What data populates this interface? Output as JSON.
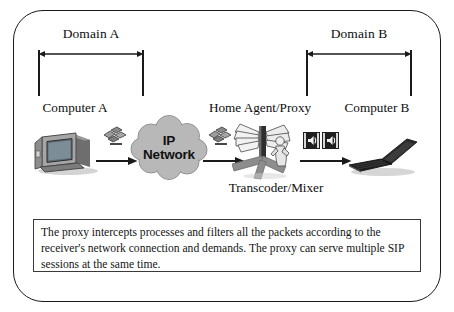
{
  "figure": {
    "domains": [
      {
        "label": "Domain A",
        "side": "left"
      },
      {
        "label": "Domain B",
        "side": "right"
      }
    ],
    "nodes": [
      {
        "id": "computer-a",
        "label": "Computer A",
        "icon": "desktop-computer-icon"
      },
      {
        "id": "ip-network",
        "label": "IP",
        "label2": "Network",
        "icon": "network-cloud-icon"
      },
      {
        "id": "home-agent-proxy",
        "label": "Home Agent/Proxy",
        "icon": "proxy-filter-icon"
      },
      {
        "id": "transcoder-mixer",
        "label": "Transcoder/Mixer",
        "icon": "transcoder-icon"
      },
      {
        "id": "computer-b",
        "label": "Computer B",
        "icon": "laptop-computer-icon"
      }
    ],
    "packets": [
      {
        "id": "packet-1",
        "icon": "packet-cluster-icon"
      },
      {
        "id": "packet-2",
        "icon": "packet-cluster-icon"
      },
      {
        "id": "media-1",
        "icon": "speaker-media-icon"
      },
      {
        "id": "media-2",
        "icon": "speaker-media-icon"
      }
    ],
    "note": "The proxy intercepts processes and filters all the packets according to the receiver's network connection and demands. The proxy can serve multiple SIP sessions at the same time.",
    "colors": {
      "line": "#1a1a1a",
      "cloud_fill": "#b8b8b8",
      "cloud_stroke": "#8e8e8e",
      "text": "#0d0d0d",
      "note_border": "#3a3a3a",
      "monitor_gray": "#8a8a8a",
      "laptop_dark": "#232323"
    }
  }
}
